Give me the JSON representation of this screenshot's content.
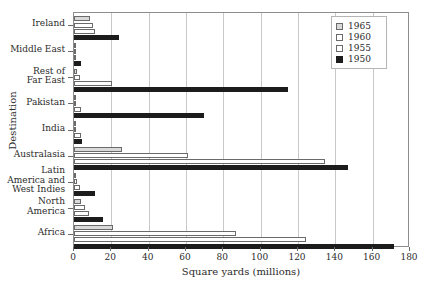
{
  "chart_data": {
    "type": "bar",
    "orientation": "horizontal",
    "title": "",
    "xlabel": "Square yards (millions)",
    "ylabel": "Destination",
    "xlim": [
      0,
      180
    ],
    "xticks": [
      0,
      20,
      40,
      60,
      80,
      100,
      120,
      140,
      160,
      180
    ],
    "grid": "vertical",
    "legend_position": "top-right",
    "categories": [
      "Ireland",
      "Middle East",
      "Rest of\nFar East",
      "Pakistan",
      "India",
      "Australasia",
      "Latin\nAmerica and\nWest Indies",
      "North\nAmerica",
      "Africa"
    ],
    "series": [
      {
        "name": "1965",
        "color": "#d9d9d9",
        "values": [
          8.5,
          0.2,
          1.5,
          0.5,
          0.3,
          25.5,
          0.5,
          4.0,
          21.0
        ]
      },
      {
        "name": "1960",
        "color": "#ffffff",
        "values": [
          10.0,
          0.2,
          3.0,
          0.7,
          0.5,
          61.0,
          1.5,
          6.0,
          87.0
        ]
      },
      {
        "name": "1955",
        "color": "#ffffff",
        "values": [
          11.5,
          0.3,
          20.5,
          3.5,
          3.5,
          134.5,
          3.0,
          8.0,
          124.5
        ]
      },
      {
        "name": "1950",
        "color": "#1c1c1c",
        "values": [
          24.0,
          3.5,
          114.5,
          69.5,
          4.5,
          147.0,
          11.5,
          15.5,
          171.5
        ]
      }
    ]
  },
  "legend": {
    "entries": [
      {
        "label": "1965"
      },
      {
        "label": "1960"
      },
      {
        "label": "1955"
      },
      {
        "label": "1950"
      }
    ]
  }
}
